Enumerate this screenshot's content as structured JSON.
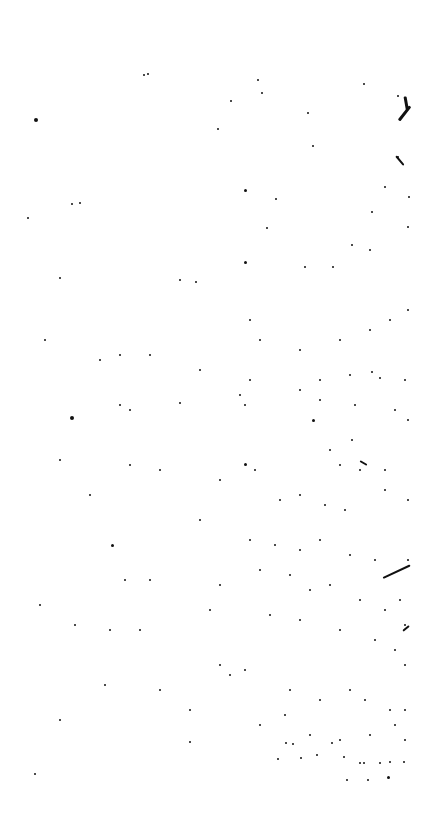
{
  "page": {
    "background": "#ffffff",
    "ink": "#111111",
    "width": 442,
    "height": 831
  },
  "specks": [
    [
      36,
      120,
      4
    ],
    [
      28,
      218,
      2
    ],
    [
      72,
      418,
      4
    ],
    [
      80,
      203,
      2
    ],
    [
      148,
      74,
      2
    ],
    [
      144,
      75,
      2
    ],
    [
      245,
      190,
      3
    ],
    [
      245,
      262,
      3
    ],
    [
      245,
      464,
      3
    ],
    [
      180,
      403,
      2
    ],
    [
      313,
      420,
      3
    ],
    [
      112,
      545,
      3
    ],
    [
      258,
      80,
      2
    ],
    [
      262,
      93,
      2
    ],
    [
      231,
      101,
      2
    ],
    [
      308,
      113,
      2
    ],
    [
      313,
      146,
      2
    ],
    [
      364,
      84,
      2
    ],
    [
      398,
      96,
      2
    ],
    [
      398,
      157,
      2
    ],
    [
      385,
      187,
      2
    ],
    [
      409,
      197,
      2
    ],
    [
      372,
      212,
      2
    ],
    [
      408,
      227,
      2
    ],
    [
      352,
      245,
      2
    ],
    [
      370,
      250,
      2
    ],
    [
      333,
      267,
      2
    ],
    [
      305,
      267,
      2
    ],
    [
      267,
      228,
      2
    ],
    [
      276,
      199,
      2
    ],
    [
      218,
      129,
      2
    ],
    [
      72,
      204,
      2
    ],
    [
      60,
      278,
      2
    ],
    [
      180,
      280,
      2
    ],
    [
      196,
      282,
      2
    ],
    [
      250,
      320,
      2
    ],
    [
      260,
      340,
      2
    ],
    [
      300,
      350,
      2
    ],
    [
      340,
      340,
      2
    ],
    [
      370,
      330,
      2
    ],
    [
      390,
      320,
      2
    ],
    [
      408,
      310,
      2
    ],
    [
      120,
      355,
      2
    ],
    [
      150,
      355,
      2
    ],
    [
      100,
      360,
      2
    ],
    [
      45,
      340,
      2
    ],
    [
      200,
      370,
      2
    ],
    [
      250,
      380,
      2
    ],
    [
      300,
      390,
      2
    ],
    [
      320,
      380,
      2
    ],
    [
      350,
      375,
      2
    ],
    [
      372,
      372,
      2
    ],
    [
      380,
      378,
      2
    ],
    [
      405,
      380,
      2
    ],
    [
      120,
      405,
      2
    ],
    [
      130,
      410,
      2
    ],
    [
      240,
      395,
      2
    ],
    [
      245,
      405,
      2
    ],
    [
      320,
      400,
      2
    ],
    [
      355,
      405,
      2
    ],
    [
      395,
      410,
      2
    ],
    [
      408,
      420,
      2
    ],
    [
      352,
      440,
      2
    ],
    [
      330,
      450,
      2
    ],
    [
      340,
      465,
      2
    ],
    [
      360,
      470,
      2
    ],
    [
      385,
      470,
      2
    ],
    [
      130,
      465,
      2
    ],
    [
      160,
      470,
      2
    ],
    [
      220,
      480,
      2
    ],
    [
      255,
      470,
      2
    ],
    [
      280,
      500,
      2
    ],
    [
      300,
      495,
      2
    ],
    [
      325,
      505,
      2
    ],
    [
      345,
      510,
      2
    ],
    [
      385,
      490,
      2
    ],
    [
      408,
      500,
      2
    ],
    [
      60,
      460,
      2
    ],
    [
      90,
      495,
      2
    ],
    [
      200,
      520,
      2
    ],
    [
      250,
      540,
      2
    ],
    [
      275,
      545,
      2
    ],
    [
      300,
      550,
      2
    ],
    [
      320,
      540,
      2
    ],
    [
      350,
      555,
      2
    ],
    [
      375,
      560,
      2
    ],
    [
      408,
      560,
      2
    ],
    [
      125,
      580,
      2
    ],
    [
      150,
      580,
      2
    ],
    [
      220,
      585,
      2
    ],
    [
      260,
      570,
      2
    ],
    [
      290,
      575,
      2
    ],
    [
      310,
      590,
      2
    ],
    [
      330,
      585,
      2
    ],
    [
      360,
      600,
      2
    ],
    [
      385,
      610,
      2
    ],
    [
      400,
      600,
      2
    ],
    [
      405,
      625,
      2
    ],
    [
      40,
      605,
      2
    ],
    [
      75,
      625,
      2
    ],
    [
      110,
      630,
      2
    ],
    [
      140,
      630,
      2
    ],
    [
      210,
      610,
      2
    ],
    [
      270,
      615,
      2
    ],
    [
      300,
      620,
      2
    ],
    [
      340,
      630,
      2
    ],
    [
      375,
      640,
      2
    ],
    [
      395,
      650,
      2
    ],
    [
      405,
      665,
      2
    ],
    [
      105,
      685,
      2
    ],
    [
      160,
      690,
      2
    ],
    [
      220,
      665,
      2
    ],
    [
      230,
      675,
      2
    ],
    [
      245,
      670,
      2
    ],
    [
      290,
      690,
      2
    ],
    [
      320,
      700,
      2
    ],
    [
      350,
      690,
      2
    ],
    [
      365,
      700,
      2
    ],
    [
      390,
      710,
      2
    ],
    [
      405,
      710,
      2
    ],
    [
      60,
      720,
      2
    ],
    [
      190,
      710,
      2
    ],
    [
      260,
      725,
      2
    ],
    [
      285,
      715,
      2
    ],
    [
      310,
      735,
      2
    ],
    [
      340,
      740,
      2
    ],
    [
      370,
      735,
      2
    ],
    [
      395,
      725,
      2
    ],
    [
      405,
      740,
      2
    ],
    [
      190,
      742,
      2
    ],
    [
      286,
      743,
      2
    ],
    [
      293,
      744,
      2
    ],
    [
      332,
      743,
      2
    ],
    [
      278,
      759,
      2
    ],
    [
      301,
      758,
      2
    ],
    [
      317,
      755,
      2
    ],
    [
      344,
      757,
      2
    ],
    [
      360,
      763,
      2
    ],
    [
      364,
      763,
      2
    ],
    [
      380,
      763,
      2
    ],
    [
      390,
      762,
      2
    ],
    [
      404,
      762,
      2
    ],
    [
      347,
      780,
      2
    ],
    [
      368,
      780,
      2
    ],
    [
      388,
      777,
      3
    ],
    [
      35,
      774,
      2
    ]
  ],
  "strokes": [
    [
      405,
      95,
      14,
      80,
      3
    ],
    [
      399,
      119,
      18,
      -52,
      3
    ],
    [
      396,
      155,
      12,
      50,
      2
    ],
    [
      383,
      577,
      30,
      -25,
      2
    ],
    [
      360,
      460,
      8,
      30,
      2
    ],
    [
      403,
      630,
      8,
      -40,
      2
    ]
  ]
}
